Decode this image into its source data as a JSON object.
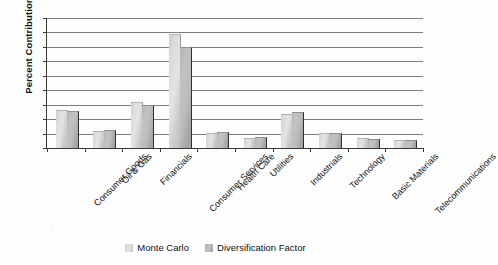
{
  "chart_data": {
    "type": "bar",
    "title": "",
    "subtitle": "",
    "xlabel": "",
    "ylabel": "Percent Contribution",
    "ylim": [
      0,
      45
    ],
    "yticks": [
      0,
      5,
      10,
      15,
      20,
      25,
      30,
      35,
      40,
      45
    ],
    "grid": true,
    "legend_position": "bottom-center",
    "categories": [
      "Consumer Goods",
      "Oil & Gas",
      "Financials",
      "Consumer Services",
      "Health Care",
      "Utilities",
      "Industrials",
      "Technology",
      "Basic Materials",
      "Telecommunications"
    ],
    "series": [
      {
        "name": "Monte Carlo",
        "color": "#dcdcdc",
        "values": [
          12.8,
          5.5,
          15.5,
          39.0,
          5.0,
          3.0,
          11.5,
          5.0,
          3.0,
          2.5
        ]
      },
      {
        "name": "Diversification Factor",
        "color": "#b9b9b9",
        "values": [
          12.5,
          6.0,
          14.5,
          34.5,
          5.3,
          3.3,
          12.0,
          4.8,
          2.8,
          2.5
        ]
      }
    ]
  },
  "legend": {
    "items": [
      {
        "label": "Monte Carlo"
      },
      {
        "label": "Diversification Factor"
      }
    ]
  }
}
